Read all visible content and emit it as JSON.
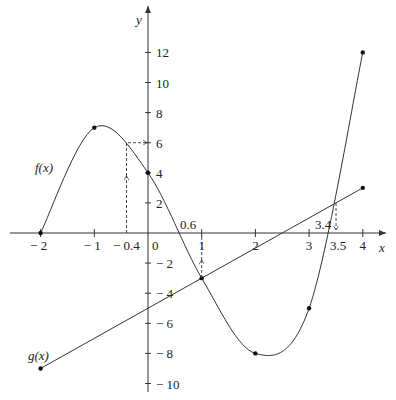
{
  "chart_data": {
    "type": "line",
    "title": "",
    "xlabel": "x",
    "ylabel": "y",
    "xlim": [
      -2.3,
      4.4
    ],
    "ylim": [
      -10.5,
      14
    ],
    "grid": false,
    "x_ticks": [
      -2,
      -1,
      0,
      1,
      2,
      3,
      4
    ],
    "x_tick_labels": [
      "− 2",
      "− 1",
      "0",
      "1",
      "2",
      "3",
      "4"
    ],
    "y_ticks": [
      12,
      10,
      8,
      6,
      4,
      2,
      -2,
      -4,
      -6,
      -8,
      -10
    ],
    "y_tick_labels": [
      "12",
      "10",
      "8",
      "6",
      "4",
      "2",
      "− 2",
      "− 4",
      "− 6",
      "− 8",
      "− 10"
    ],
    "series": [
      {
        "name": "f(x)",
        "style": "smooth curve",
        "x": [
          -2,
          -1,
          0,
          1,
          2,
          3,
          4
        ],
        "y": [
          0,
          7,
          4,
          -3,
          -8,
          -5,
          12
        ]
      },
      {
        "name": "g(x)",
        "style": "straight line",
        "x": [
          -2,
          4
        ],
        "y": [
          -9,
          3
        ]
      }
    ],
    "annotations": [
      {
        "text": "− 0.4",
        "x": -0.4,
        "note": "dashed arrow up from x-axis to f(-0.4)≈6, then right to y=6"
      },
      {
        "text": "0.6",
        "x": 0.6,
        "note": "zero of f"
      },
      {
        "text": "1",
        "x": 1,
        "note": "dashed arrow up from f(1)=-3 to x-axis"
      },
      {
        "text": "3.4",
        "x": 3.4,
        "note": "zero of f"
      },
      {
        "text": "3.5",
        "x": 3.5,
        "note": "dashed arrow down from intersection of f and g to x-axis"
      }
    ],
    "legend": "inline labels f(x) and g(x) at left"
  },
  "labels": {
    "x_axis": "x",
    "y_axis": "y",
    "f": "f(x)",
    "g": "g(x)",
    "ann_m04": "− 0.4",
    "ann_06": "0.6",
    "ann_34": "3.4",
    "ann_35": "3.5",
    "origin": "0"
  }
}
